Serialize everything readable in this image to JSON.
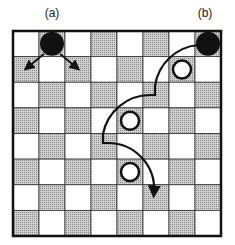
{
  "labels": [
    {
      "id": "a",
      "text": "(a)",
      "x": 52,
      "y": 6
    },
    {
      "id": "b",
      "text": "(b)",
      "x": 205,
      "y": 6
    }
  ],
  "board": {
    "rows": 8,
    "cols": 8,
    "x": 13,
    "y": 31,
    "width": 208,
    "height": 205,
    "light_color": "#ffffff",
    "dark_color": "#b8b8b8",
    "dark_parity": "odd"
  },
  "pieces": [
    {
      "label": "a",
      "color": "black",
      "row": 0,
      "col": 1
    },
    {
      "label": "b",
      "color": "black",
      "row": 0,
      "col": 7
    },
    {
      "label": "",
      "color": "white",
      "row": 1,
      "col": 6
    },
    {
      "label": "",
      "color": "white",
      "row": 3,
      "col": 4
    },
    {
      "label": "",
      "color": "white",
      "row": 5,
      "col": 4
    }
  ],
  "moves": {
    "piece_a_arrows": [
      {
        "from": [
          44,
          54
        ],
        "to": [
          28,
          67
        ]
      },
      {
        "from": [
          60,
          54
        ],
        "to": [
          76,
          67
        ]
      }
    ],
    "piece_b_jump_path": "M 198 45 A 48 48 0 0 0 155 86 L 155 95 L 150 95 A 48 48 0 0 0 103 134 L 103 143 L 108 143 A 46 46 0 0 1 154 192",
    "piece_b_arrow_tip": [
      154,
      199
    ]
  }
}
